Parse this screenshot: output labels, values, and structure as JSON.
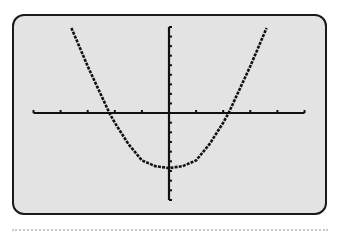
{
  "chart_data": {
    "type": "line",
    "title": "",
    "xlabel": "",
    "ylabel": "",
    "series": [
      {
        "name": "parabola",
        "x": [
          -3.6,
          -3.0,
          -2.2,
          -2.0,
          -1.5,
          -1.0,
          -0.5,
          0,
          0.5,
          1.0,
          1.5,
          2.0,
          2.2,
          3.0,
          3.6
        ],
        "y": [
          8.9,
          4.9,
          0,
          -1.0,
          -3.2,
          -4.9,
          -5.5,
          -5.7,
          -5.5,
          -4.9,
          -3.2,
          -1.0,
          0,
          4.9,
          8.9
        ]
      }
    ],
    "xlim": [
      -5,
      5
    ],
    "ylim": [
      -9,
      9
    ],
    "xticks_every": 1,
    "yticks_every": 1,
    "grid": false,
    "legend": false,
    "colors": {
      "screen_bg": "#e3e3e3",
      "frame": "#1a1a1a",
      "curve": "#111111",
      "axes": "#111111"
    }
  }
}
